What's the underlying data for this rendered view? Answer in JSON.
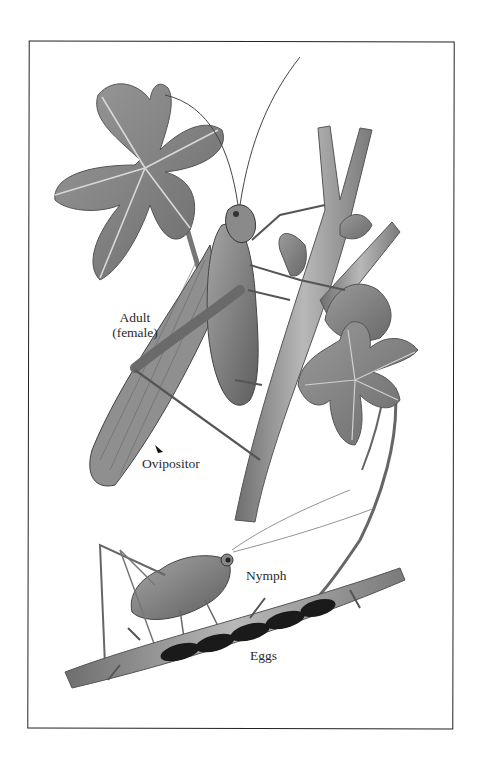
{
  "illustration": {
    "subject": "katydid life stages on bramble",
    "style": "grayscale scientific illustration",
    "labels": {
      "adult": "Adult",
      "adult_sub": "(female)",
      "ovipositor": "Ovipositor",
      "nymph": "Nymph",
      "eggs": "Eggs"
    },
    "colors": {
      "frame": "#222222",
      "leaf": "#8a8a8a",
      "stem": "#9a9a9a",
      "insect": "#7d7d7d",
      "eggs": "#1a1a1a",
      "text": "#2a2a2a"
    }
  }
}
